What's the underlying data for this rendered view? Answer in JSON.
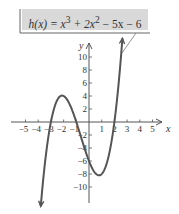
{
  "chart_data": {
    "type": "line",
    "function": "x^3 + 2x^2 - 5x - 6",
    "label_html_parts": [
      "h(x) = x",
      "3",
      " + 2x",
      "2",
      " − 5x − 6"
    ],
    "xlabel": "x",
    "ylabel": "y",
    "xlim": [
      -5.5,
      5.5
    ],
    "ylim": [
      -12,
      12
    ],
    "x_ticks": [
      -5,
      -4,
      -3,
      -2,
      -1,
      1,
      2,
      3,
      4,
      5
    ],
    "x_tick_labels": [
      "−5",
      "−4",
      "−3",
      "−2",
      "−1",
      "1",
      "2",
      "3",
      "4",
      "5"
    ],
    "y_ticks": [
      10,
      8,
      6,
      4,
      2,
      -2,
      -4,
      -6,
      -8,
      -10
    ],
    "y_tick_labels": [
      "10",
      "8",
      "6",
      "4",
      "2",
      "−2",
      "−4",
      "−6",
      "−8",
      "−10"
    ],
    "grid": false,
    "x_range_plotted": [
      -3.8,
      2.63
    ],
    "key_points": [
      {
        "x": -3,
        "y": 0
      },
      {
        "x": -1,
        "y": 0
      },
      {
        "x": 2,
        "y": 0
      },
      {
        "x": 0,
        "y": -6
      },
      {
        "x": -2.1,
        "y": 4.1
      },
      {
        "x": 0.8,
        "y": -8.2
      }
    ],
    "colors": {
      "curve": "#555555",
      "axes": "#555555",
      "label_bg": "#d9d9d9"
    }
  }
}
